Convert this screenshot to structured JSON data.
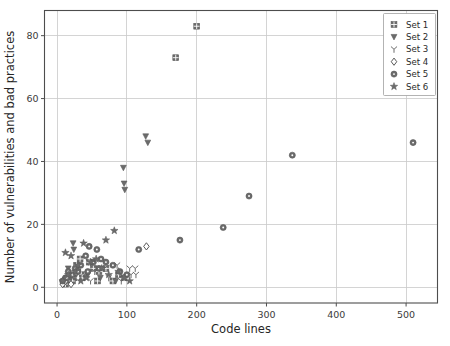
{
  "chart_data": {
    "type": "scatter",
    "title": "",
    "xlabel": "Code lines",
    "ylabel": "Number of vulnerabilities and bad practices",
    "xlim": [
      -18,
      545
    ],
    "ylim": [
      -5,
      88
    ],
    "xticks": [
      0,
      100,
      200,
      300,
      400,
      500
    ],
    "xticklabels": [
      "0",
      "100",
      "200",
      "300",
      "400",
      "500"
    ],
    "yticks": [
      0,
      20,
      40,
      60,
      80
    ],
    "yticklabels": [
      "0",
      "20",
      "40",
      "60",
      "80"
    ],
    "grid": true,
    "grid_axis": "both",
    "legend_position": "upper right",
    "marker_color": "#6b6b6b",
    "grid_color": "#c9c9c9",
    "spine_color": "#4d4d4d",
    "series": [
      {
        "name": "Set 1",
        "marker": "square-plus-filled",
        "points": [
          [
            200,
            83
          ],
          [
            170,
            73
          ],
          [
            33,
            9
          ],
          [
            28,
            7
          ],
          [
            46,
            8
          ],
          [
            52,
            6
          ],
          [
            40,
            4
          ],
          [
            24,
            3
          ],
          [
            60,
            5
          ],
          [
            18,
            2
          ],
          [
            70,
            6
          ],
          [
            88,
            4
          ],
          [
            96,
            3
          ],
          [
            12,
            1
          ],
          [
            22,
            2
          ],
          [
            36,
            3
          ],
          [
            58,
            2
          ],
          [
            80,
            2
          ]
        ]
      },
      {
        "name": "Set 2",
        "marker": "triangle-down",
        "points": [
          [
            127,
            48
          ],
          [
            130,
            46
          ],
          [
            95,
            38
          ],
          [
            96,
            33
          ],
          [
            97,
            31
          ],
          [
            23,
            14
          ],
          [
            24,
            12
          ],
          [
            16,
            6
          ],
          [
            30,
            5
          ],
          [
            44,
            4
          ],
          [
            10,
            2
          ],
          [
            20,
            3
          ],
          [
            62,
            3
          ],
          [
            84,
            2
          ]
        ]
      },
      {
        "name": "Set 3",
        "marker": "tri-down",
        "points": [
          [
            104,
            6
          ],
          [
            106,
            4
          ],
          [
            112,
            6
          ],
          [
            113,
            4
          ],
          [
            86,
            7
          ],
          [
            68,
            6
          ],
          [
            54,
            5
          ],
          [
            40,
            4
          ],
          [
            26,
            3
          ],
          [
            14,
            2
          ],
          [
            48,
            2
          ],
          [
            74,
            3
          ],
          [
            92,
            2
          ]
        ]
      },
      {
        "name": "Set 4",
        "marker": "diamond-open",
        "points": [
          [
            128,
            13
          ],
          [
            8,
            1
          ],
          [
            12,
            2
          ],
          [
            20,
            1
          ]
        ]
      },
      {
        "name": "Set 5",
        "marker": "circle-dot",
        "points": [
          [
            510,
            46
          ],
          [
            337,
            42
          ],
          [
            275,
            29
          ],
          [
            238,
            19
          ],
          [
            176,
            15
          ],
          [
            117,
            12
          ],
          [
            46,
            13
          ],
          [
            57,
            12
          ],
          [
            41,
            10
          ],
          [
            63,
            9
          ],
          [
            52,
            8
          ],
          [
            34,
            7
          ],
          [
            70,
            8
          ],
          [
            26,
            6
          ],
          [
            16,
            5
          ],
          [
            80,
            7
          ],
          [
            22,
            4
          ],
          [
            12,
            3
          ],
          [
            90,
            5
          ],
          [
            100,
            4
          ],
          [
            8,
            2
          ],
          [
            30,
            5
          ],
          [
            60,
            6
          ],
          [
            44,
            5
          ],
          [
            14,
            3
          ]
        ]
      },
      {
        "name": "Set 6",
        "marker": "star",
        "points": [
          [
            82,
            18
          ],
          [
            70,
            15
          ],
          [
            38,
            14
          ],
          [
            12,
            11
          ],
          [
            20,
            10
          ],
          [
            56,
            9
          ],
          [
            48,
            8
          ],
          [
            30,
            7
          ],
          [
            64,
            6
          ],
          [
            26,
            5
          ],
          [
            16,
            4
          ],
          [
            88,
            5
          ],
          [
            96,
            3
          ],
          [
            8,
            2
          ],
          [
            42,
            3
          ],
          [
            74,
            4
          ],
          [
            34,
            2
          ],
          [
            104,
            2
          ]
        ]
      }
    ]
  },
  "legend": {
    "items": [
      {
        "label": "Set 1"
      },
      {
        "label": "Set 2"
      },
      {
        "label": "Set 3"
      },
      {
        "label": "Set 4"
      },
      {
        "label": "Set 5"
      },
      {
        "label": "Set 6"
      }
    ]
  }
}
